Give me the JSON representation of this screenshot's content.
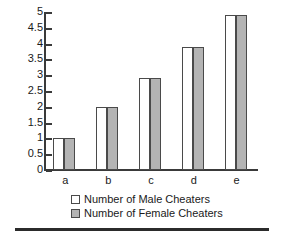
{
  "chart_data": {
    "type": "bar",
    "title": "",
    "xlabel": "",
    "ylabel": "",
    "categories": [
      "a",
      "b",
      "c",
      "d",
      "e"
    ],
    "series": [
      {
        "name": "Number of Male Cheaters",
        "color": "#ffffff",
        "values": [
          1,
          2,
          2.9,
          3.9,
          4.9
        ]
      },
      {
        "name": "Number of Female Cheaters",
        "color": "#b4b4b4",
        "values": [
          1,
          2,
          2.9,
          3.9,
          4.9
        ]
      }
    ],
    "ylim": [
      0,
      5
    ],
    "yticks": [
      0,
      0.5,
      1,
      1.5,
      2,
      2.5,
      3,
      3.5,
      4,
      4.5,
      5
    ],
    "ytick_labels": [
      "0",
      "0.5",
      "1",
      "1.5",
      "2",
      "2.5",
      "3",
      "3.5",
      "4",
      "4.5",
      "5"
    ],
    "grid": false,
    "legend_position": "bottom"
  },
  "legend": {
    "items": [
      {
        "label": "Number of Male Cheaters",
        "swatch": "male"
      },
      {
        "label": "Number of Female Cheaters",
        "swatch": "female"
      }
    ]
  },
  "axis": {
    "tick_labels": [
      "5",
      "4.5",
      "4",
      "3.5",
      "3",
      "2.5",
      "2",
      "1.5",
      "1",
      "0.5",
      "0"
    ],
    "category_labels": [
      "a",
      "b",
      "c",
      "d",
      "e"
    ]
  }
}
